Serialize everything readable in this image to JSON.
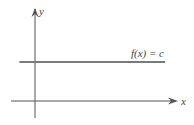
{
  "chart_data": {
    "type": "line",
    "title": "",
    "xlabel": "x",
    "ylabel": "y",
    "xlim": [
      -1,
      5
    ],
    "ylim": [
      -1,
      3
    ],
    "grid": false,
    "series": [
      {
        "name": "f(x) = c",
        "label": "f(x) = c",
        "x": [
          -0.6,
          5.0
        ],
        "y": [
          1.5,
          1.5
        ]
      }
    ],
    "annotations": [
      "f(x) = c"
    ]
  },
  "colors": {
    "axis": "#555555",
    "function_line": "#7a7a7a",
    "text": "#444444"
  }
}
